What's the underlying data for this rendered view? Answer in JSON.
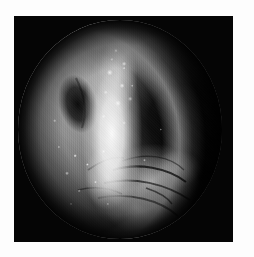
{
  "page": {
    "background_color": "#ffffff",
    "width": 254,
    "height": 257
  },
  "photo": {
    "alt_text": "Endoscopic image",
    "frame_color": "#050505",
    "frame_left": 14,
    "frame_top": 16,
    "frame_width": 219,
    "frame_height": 226,
    "modality": "endoscopy",
    "color_mode": "grayscale",
    "field_of_view_shape": "circular"
  },
  "scene": {
    "description": "Circular endoscopic view of mucosal tissue",
    "regions": [
      {
        "name": "upper-left-mucosa",
        "label": "Gray mucosal surface",
        "tone": "#8e8e8e"
      },
      {
        "name": "dark-lesion-shadow",
        "label": "Dark shadow blotch",
        "tone": "#0a0a0a"
      },
      {
        "name": "central-bright-band",
        "label": "Bright reflective tissue band",
        "tone": "#f2f2f2"
      },
      {
        "name": "right-dark-cavity",
        "label": "Dark cavity",
        "tone": "#050505"
      },
      {
        "name": "lower-left-textured-tissue",
        "label": "Speckled textured tissue",
        "tone": "#9a9a9a"
      },
      {
        "name": "lower-right-folds",
        "label": "Folded tissue lobes",
        "tone": "#c8c8c8"
      },
      {
        "name": "upper-right-rim-arc",
        "label": "Bright specular rim arc",
        "tone": "#d7d7d7"
      }
    ],
    "caption": ""
  }
}
